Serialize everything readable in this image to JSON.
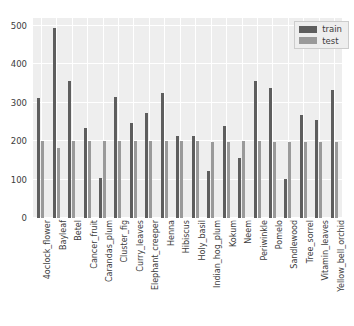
{
  "chart_data": {
    "type": "bar",
    "title": "",
    "xlabel": "",
    "ylabel": "",
    "ylim": [
      0,
      520
    ],
    "yticks": [
      0,
      100,
      200,
      300,
      400,
      500
    ],
    "grid": true,
    "legend_position": "upper right",
    "categories": [
      "4oclock_flower",
      "Bayleaf",
      "Betel",
      "Cancer_fruit",
      "Carandas_plum",
      "Cluster_fig",
      "Curry_leaves",
      "Elephant_creeper",
      "Henna",
      "Hibiscus",
      "Holy_basil",
      "Indian_hog_plum",
      "Kokum",
      "Neem",
      "Periwinkle",
      "Pomelo",
      "Sandlewood",
      "Tree_sorrel",
      "Vitamin_leaves",
      "Yellow_bell_orchid"
    ],
    "series": [
      {
        "name": "train",
        "color": "#5e5e5e",
        "values": [
          311,
          493,
          356,
          234,
          105,
          315,
          246,
          272,
          324,
          213,
          212,
          121,
          238,
          156,
          357,
          338,
          102,
          268,
          256,
          333
        ]
      },
      {
        "name": "test",
        "color": "#9a9a9a",
        "values": [
          200,
          181,
          200,
          199,
          200,
          200,
          200,
          200,
          199,
          200,
          200,
          197,
          197,
          199,
          199,
          198,
          197,
          197,
          197,
          197
        ]
      }
    ]
  },
  "legend": {
    "entries": [
      {
        "label": "train"
      },
      {
        "label": "test"
      }
    ]
  },
  "style": {
    "plot_background": "#eeeeee",
    "figure_background": "#ffffff",
    "gridline_color": "#ffffff",
    "tick_label_color": "#3c3c3c"
  }
}
